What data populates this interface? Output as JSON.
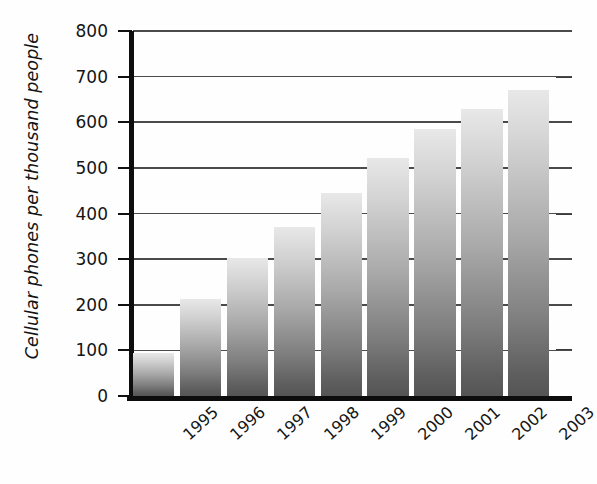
{
  "chart_data": {
    "type": "bar",
    "title": "",
    "subtitle": "",
    "xlabel": "",
    "ylabel": "Cellular phones per thousand people",
    "categories": [
      "1995",
      "1996",
      "1997",
      "1998",
      "1999",
      "2000",
      "2001",
      "2002",
      "2003"
    ],
    "values": [
      95,
      213,
      302,
      370,
      445,
      522,
      585,
      630,
      670
    ],
    "series": [
      {
        "name": "Cellular phones per thousand people",
        "values": [
          95,
          213,
          302,
          370,
          445,
          522,
          585,
          630,
          670
        ]
      }
    ],
    "ylim": [
      0,
      800
    ],
    "yticks": [
      0,
      100,
      200,
      300,
      400,
      500,
      600,
      700,
      800
    ],
    "ytick_labels": [
      "0",
      "100",
      "200",
      "300",
      "400",
      "500",
      "600",
      "700",
      "800"
    ],
    "grid": true,
    "grid_axis": "y",
    "legend": false,
    "legend_position": "none",
    "bar_gradient_top": "#e8e8e8",
    "bar_gradient_bottom": "#555555",
    "axis_color": "#0d0d0d",
    "grid_color": "#4a4a4a",
    "text_color": "#141414",
    "background": "#ffffff",
    "xtick_rotation": -42
  }
}
